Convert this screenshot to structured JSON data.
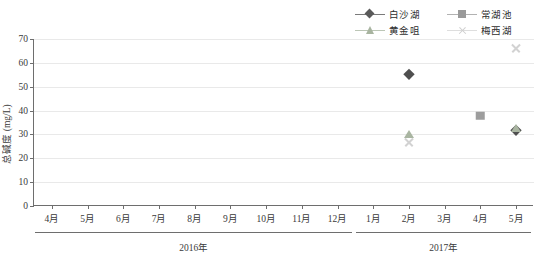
{
  "chart_data": {
    "type": "scatter",
    "title": "",
    "xlabel": "",
    "ylabel": "总碱度 (mg/L)",
    "ylim": [
      0,
      70
    ],
    "yticks": [
      0,
      10,
      20,
      30,
      40,
      50,
      60,
      70
    ],
    "grid": true,
    "legend_position": "top-right",
    "categories": [
      "4月",
      "5月",
      "6月",
      "7月",
      "8月",
      "9月",
      "10月",
      "11月",
      "12月",
      "1月",
      "2月",
      "3月",
      "4月",
      "5月"
    ],
    "x_groups": [
      {
        "label": "2016年",
        "start_index": 0,
        "end_index": 8
      },
      {
        "label": "2017年",
        "start_index": 9,
        "end_index": 13
      }
    ],
    "series": [
      {
        "name": "白沙湖",
        "marker": "diamond",
        "color": "#4f4f4f",
        "values": [
          null,
          null,
          null,
          null,
          null,
          null,
          null,
          null,
          null,
          null,
          55.5,
          null,
          null,
          32.0
        ]
      },
      {
        "name": "常湖池",
        "marker": "square",
        "color": "#9d9d9d",
        "values": [
          null,
          null,
          null,
          null,
          null,
          null,
          null,
          null,
          null,
          null,
          null,
          null,
          37.8,
          null
        ]
      },
      {
        "name": "黄金咀",
        "marker": "triangle",
        "color": "#a9b5a1",
        "values": [
          null,
          null,
          null,
          null,
          null,
          null,
          null,
          null,
          null,
          null,
          30.0,
          null,
          null,
          32.7
        ]
      },
      {
        "name": "梅西湖",
        "marker": "cross",
        "color": "#d2d2d2",
        "values": [
          null,
          null,
          null,
          null,
          null,
          null,
          null,
          null,
          null,
          null,
          26.8,
          null,
          null,
          66.0
        ]
      }
    ]
  },
  "legend": {
    "entries": [
      {
        "label": "白沙湖",
        "marker": "diamond-icon"
      },
      {
        "label": "常湖池",
        "marker": "square-icon"
      },
      {
        "label": "黄金咀",
        "marker": "triangle-icon"
      },
      {
        "label": "梅西湖",
        "marker": "cross-icon"
      }
    ]
  }
}
